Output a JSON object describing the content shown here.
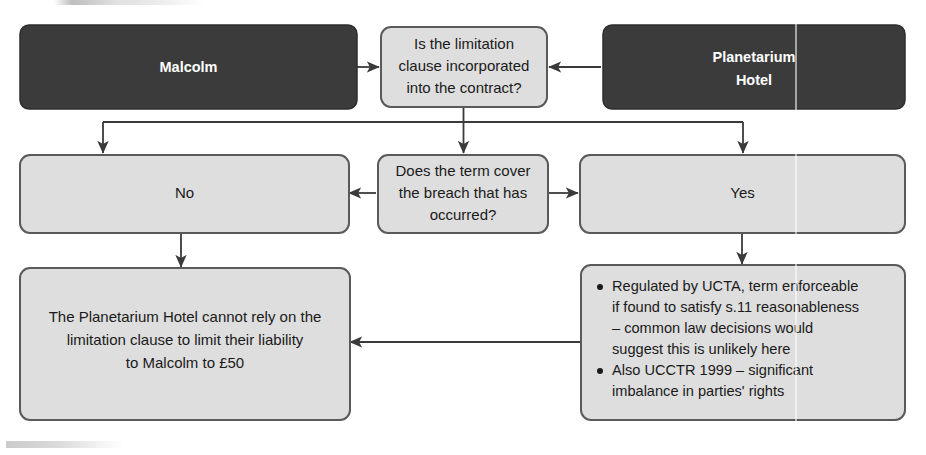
{
  "diagram": {
    "type": "flowchart",
    "colors": {
      "party_box_fill": "#3b3b3b",
      "party_box_text": "#ffffff",
      "step_box_fill": "#dedede",
      "step_box_stroke": "#5a5a5a",
      "text": "#1a1a1a",
      "connector": "#3a3a3a"
    },
    "nodes": {
      "party_claimant": {
        "label": "Malcolm",
        "style": "dark"
      },
      "party_defendant": {
        "label": "Planetarium\nHotel",
        "line1": "Planetarium",
        "line2": "Hotel",
        "style": "dark"
      },
      "question_incorporation": {
        "line1": "Is the limitation",
        "line2": "clause incorporated",
        "line3": "into the contract?",
        "style": "light"
      },
      "answer_no": {
        "label": "No",
        "style": "light"
      },
      "question_coverage": {
        "line1": "Does the term cover",
        "line2": "the breach that has",
        "line3": "occurred?",
        "style": "light"
      },
      "answer_yes": {
        "label": "Yes",
        "style": "light"
      },
      "outcome_conclusion": {
        "line1": "The Planetarium Hotel cannot rely on the",
        "line2": "limitation clause to limit their liability",
        "line3": "to Malcolm to £50",
        "style": "light"
      },
      "outcome_statutory": {
        "style": "light",
        "bullets": [
          {
            "lines": [
              "Regulated by UCTA, term enforceable",
              "if found to satisfy s.11 reasonableness",
              "– common law decisions would",
              "suggest this is unlikely here"
            ]
          },
          {
            "lines": [
              "Also UCCTR 1999 – significant",
              "imbalance in parties' rights"
            ]
          }
        ]
      }
    },
    "edges": [
      {
        "name": "malcolm-to-question",
        "from": "party_claimant",
        "to": "question_incorporation"
      },
      {
        "name": "hotel-to-question",
        "from": "party_defendant",
        "to": "question_incorporation"
      },
      {
        "name": "question-to-no",
        "from": "question_incorporation",
        "to": "answer_no"
      },
      {
        "name": "question-to-coverage",
        "from": "question_incorporation",
        "to": "question_coverage"
      },
      {
        "name": "question-to-yes",
        "from": "question_incorporation",
        "to": "answer_yes"
      },
      {
        "name": "coverage-to-no",
        "from": "question_coverage",
        "to": "answer_no"
      },
      {
        "name": "coverage-to-yes",
        "from": "question_coverage",
        "to": "answer_yes"
      },
      {
        "name": "no-to-conclusion",
        "from": "answer_no",
        "to": "outcome_conclusion"
      },
      {
        "name": "yes-to-statutory",
        "from": "answer_yes",
        "to": "outcome_statutory"
      },
      {
        "name": "statutory-to-conclusion",
        "from": "outcome_statutory",
        "to": "outcome_conclusion"
      }
    ]
  }
}
